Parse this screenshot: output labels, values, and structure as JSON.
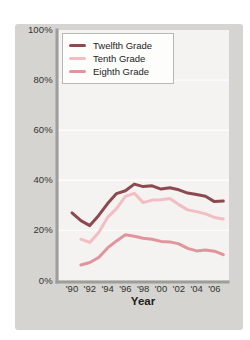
{
  "chart_data": {
    "type": "line",
    "title": "",
    "xlabel": "Year",
    "ylabel": "",
    "ylim": [
      0,
      100
    ],
    "grid": true,
    "legend_position": "top-left-inside",
    "y_ticks": [
      {
        "label": "100%",
        "value": 100
      },
      {
        "label": "80%",
        "value": 80
      },
      {
        "label": "60%",
        "value": 60
      },
      {
        "label": "40%",
        "value": 40
      },
      {
        "label": "20%",
        "value": 20
      },
      {
        "label": "0%",
        "value": 0
      }
    ],
    "x_ticks": [
      {
        "label": "'90",
        "year": 1990
      },
      {
        "label": "'92",
        "year": 1992
      },
      {
        "label": "'94",
        "year": 1994
      },
      {
        "label": "'96",
        "year": 1996
      },
      {
        "label": "'98",
        "year": 1998
      },
      {
        "label": "'00",
        "year": 2000
      },
      {
        "label": "'02",
        "year": 2002
      },
      {
        "label": "'04",
        "year": 2004
      },
      {
        "label": "'06",
        "year": 2006
      }
    ],
    "x_range": [
      1990,
      2007
    ],
    "series": [
      {
        "name": "Twelfth Grade",
        "color": "#8d4950",
        "start_year": 1990,
        "values": [
          27.0,
          23.9,
          21.9,
          26.0,
          30.7,
          34.7,
          35.8,
          38.5,
          37.5,
          37.8,
          36.5,
          37.0,
          36.2,
          34.9,
          34.3,
          33.6,
          31.5,
          31.7
        ]
      },
      {
        "name": "Tenth Grade",
        "color": "#f2bdc3",
        "start_year": 1991,
        "values": [
          16.5,
          15.2,
          19.2,
          25.2,
          28.7,
          33.6,
          34.8,
          31.1,
          32.1,
          32.2,
          32.7,
          30.3,
          28.2,
          27.5,
          26.6,
          25.2,
          24.6
        ]
      },
      {
        "name": "Eighth Grade",
        "color": "#e2949c",
        "start_year": 1991,
        "values": [
          6.2,
          7.2,
          9.2,
          13.0,
          15.8,
          18.3,
          17.7,
          16.9,
          16.5,
          15.6,
          15.4,
          14.6,
          12.8,
          11.8,
          12.2,
          11.7,
          10.3
        ]
      }
    ],
    "colors": {
      "panel_bg": "#d5d4d1",
      "plot_bg": "#f4f3f1",
      "gridline": "#ffffff",
      "axis": "#9d9d9a"
    }
  }
}
